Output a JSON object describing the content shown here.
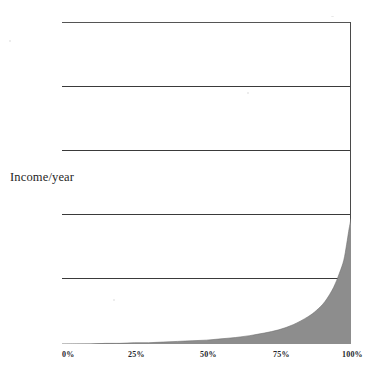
{
  "figure": {
    "title": "FIGURE 1: GLOBAL INCOME DISTRIBUTION",
    "y_axis_label": "Income/year"
  },
  "chart_data": {
    "type": "area",
    "title": "FIGURE 1: GLOBAL INCOME DISTRIBUTION",
    "xlabel": "",
    "ylabel": "Income/year",
    "xlim": [
      0,
      100
    ],
    "ylim": [
      0,
      5
    ],
    "grid": true,
    "legend": null,
    "fill_color": "#8d8d8d",
    "x_tick_labels": [
      "0%",
      "25%",
      "50%",
      "75%",
      "100%"
    ],
    "x_tick_values": [
      0,
      25,
      50,
      75,
      100
    ],
    "y_tick_labels": [
      "",
      "",
      "",
      "",
      "",
      ""
    ],
    "y_gridline_values": [
      0,
      1,
      2,
      3,
      4,
      5
    ],
    "series": [
      {
        "name": "Income/year",
        "x": [
          0,
          5,
          10,
          15,
          20,
          25,
          30,
          35,
          40,
          45,
          50,
          55,
          60,
          65,
          70,
          75,
          80,
          85,
          88,
          91,
          94,
          96,
          97.5,
          98.5,
          99.2,
          99.6,
          100
        ],
        "values": [
          0.0,
          0.0,
          0.0,
          0.01,
          0.01,
          0.02,
          0.02,
          0.03,
          0.04,
          0.05,
          0.06,
          0.08,
          0.1,
          0.13,
          0.17,
          0.22,
          0.3,
          0.42,
          0.52,
          0.66,
          0.88,
          1.1,
          1.3,
          1.55,
          1.75,
          1.85,
          1.95
        ]
      }
    ]
  },
  "x_ticks": [
    {
      "label": "0%",
      "left_px": 0,
      "align": "left"
    },
    {
      "label": "25%",
      "left_px": 66,
      "align": "left"
    },
    {
      "label": "50%",
      "left_px": 138,
      "align": "left"
    },
    {
      "label": "75%",
      "left_px": 211,
      "align": "left"
    },
    {
      "label": "100%",
      "left_px": 280,
      "align": "right"
    }
  ],
  "colors": {
    "background": "#ffffff",
    "ink": "#1f1f1f",
    "rule": "#3a3a3a",
    "fill": "#8d8d8d"
  }
}
